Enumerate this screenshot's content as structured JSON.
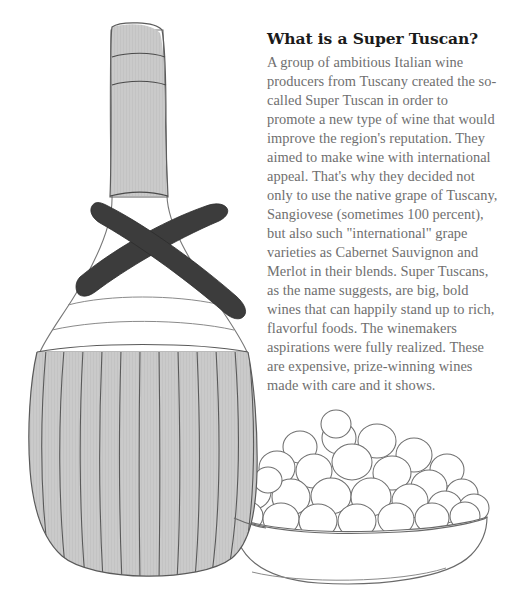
{
  "article": {
    "title": "What is a Super Tuscan?",
    "body": "A group of ambitious Italian wine\nproducers from Tuscany created the so-\ncalled Super Tuscan in order to\npromote a new type of wine that would\nimprove the region's reputation. They\naimed to make wine with international\nappeal. That's why they decided not\nonly to use the native grape of Tuscany,\nSangiovese (sometimes 100 percent),\nbut also such \"international\" grape\nvarieties as Cabernet Sauvignon and\nMerlot in their blends. Super Tuscans,\nas the name suggests, are big, bold\nwines that can happily stand up to rich,\nflavorful foods. The winemakers\naspirations were fully realized. These\nare expensive, prize-winning wines\nmade with care and it shows."
  },
  "illustration": {
    "alt_label": "Straw-wrapped Italian wine fiasco bottle beside a bowl of grapes",
    "parts": {
      "bottle_capsule": "foil capsule on bottle neck",
      "bottle_neck": "bottle neck",
      "bottle_shoulder": "bottle shoulder",
      "straw_basket": "woven straw fiasco basket",
      "crossed_straps": "crossed dark carrying straps",
      "grape_bowl": "bowl of grapes",
      "grapes": "mound of grapes"
    },
    "colors": {
      "fill_gray": "#cacaca",
      "line_dark": "#555555",
      "line_light": "#8a8a8a",
      "strap_dark": "#3c3c3c",
      "bowl_white": "#ffffff",
      "grape_outline": "#707070"
    },
    "counts": {
      "basket_ribs": 12,
      "capsule_bands": 3,
      "shoulder_bands": 2,
      "grapes": 27
    }
  },
  "text_colors": {
    "title": "#1a1a1a",
    "body": "#6f6f6f"
  }
}
